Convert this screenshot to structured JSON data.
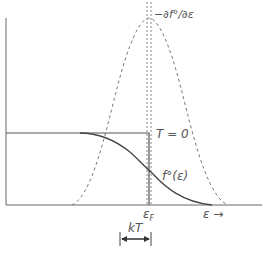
{
  "diagram": {
    "labels": {
      "derivative": "−∂f°/∂ε",
      "step": "T = 0",
      "fermi": "f°(ε)",
      "fermi_level": "εF",
      "fermi_level_main": "ε",
      "fermi_level_sub": "F",
      "energy_axis": "ε →",
      "width": "kT"
    },
    "colors": {
      "line": "#555555",
      "dashed": "#777777",
      "background": "#ffffff"
    }
  }
}
